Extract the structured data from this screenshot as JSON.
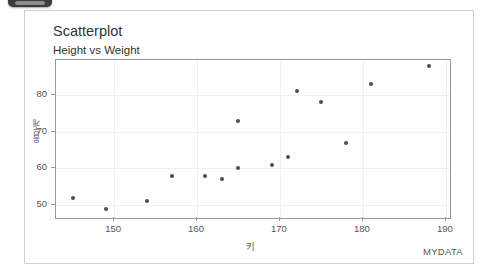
{
  "window": {
    "chip_name": "toolbar-chip"
  },
  "card": {
    "title": "Scatterplot",
    "subtitle": "Height vs Weight",
    "dataset_label": "MYDATA"
  },
  "chart_data": {
    "type": "scatter",
    "title": "Scatterplot",
    "subtitle": "Height vs Weight",
    "xlabel": "키",
    "ylabel": "몸무게",
    "xlim": [
      143,
      190.5
    ],
    "ylim": [
      46.5,
      89.5
    ],
    "xticks": [
      150,
      160,
      170,
      180,
      190
    ],
    "yticks": [
      50,
      60,
      70,
      80
    ],
    "grid": true,
    "legend": null,
    "point_color": "#4d4d4d",
    "frame_color": "#9a9a9a",
    "grid_color": "#f0f0f0",
    "points": [
      {
        "x": 145,
        "y": 52
      },
      {
        "x": 149,
        "y": 49
      },
      {
        "x": 154,
        "y": 51
      },
      {
        "x": 157,
        "y": 58
      },
      {
        "x": 161,
        "y": 58
      },
      {
        "x": 163,
        "y": 57
      },
      {
        "x": 165,
        "y": 60
      },
      {
        "x": 165,
        "y": 73
      },
      {
        "x": 169,
        "y": 61
      },
      {
        "x": 171,
        "y": 63
      },
      {
        "x": 172,
        "y": 81
      },
      {
        "x": 175,
        "y": 78
      },
      {
        "x": 178,
        "y": 67
      },
      {
        "x": 181,
        "y": 83
      },
      {
        "x": 188,
        "y": 88
      }
    ]
  }
}
